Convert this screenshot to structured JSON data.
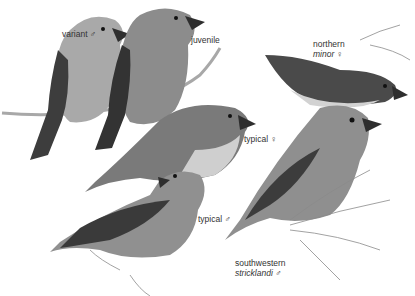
{
  "plate": {
    "background": "#ffffff",
    "labels": [
      {
        "id": "variant-male",
        "line1": "variant ♂",
        "x": 62,
        "y": 29
      },
      {
        "id": "juvenile",
        "line1": "juvenile",
        "x": 191,
        "y": 35
      },
      {
        "id": "northern-minor-female",
        "line1": "northern",
        "line2": "minor ♀",
        "x": 313,
        "y": 39
      },
      {
        "id": "typical-female",
        "line1": "typical ♀",
        "x": 244,
        "y": 134
      },
      {
        "id": "typical-male",
        "line1": "typical ♂",
        "x": 198,
        "y": 214
      },
      {
        "id": "southwestern-stricklandi-male",
        "line1": "southwestern",
        "line2": "stricklandi ♂",
        "x": 235,
        "y": 258
      }
    ]
  },
  "colors": {
    "dark_wing": "#3a3a3a",
    "mid_body": "#8a8a8a",
    "light_body": "#b8b8b8",
    "belly_pale": "#d8d8d8",
    "branch": "#a0a0a0",
    "needles": "#7a7a7a"
  }
}
